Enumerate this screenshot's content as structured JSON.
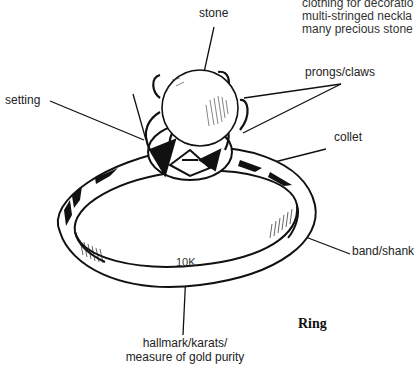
{
  "body_text": {
    "lines": [
      "clothing for decoratio",
      "multi-stringed  neckla",
      "many precious stone"
    ]
  },
  "labels": {
    "stone": "stone",
    "setting": "setting",
    "prongs": "prongs/claws",
    "collet": "collet",
    "band": "band/shank",
    "hallmark_line1": "hallmark/karats/",
    "hallmark_line2": "measure of gold purity"
  },
  "engraving": "10K",
  "caption": "Ring"
}
